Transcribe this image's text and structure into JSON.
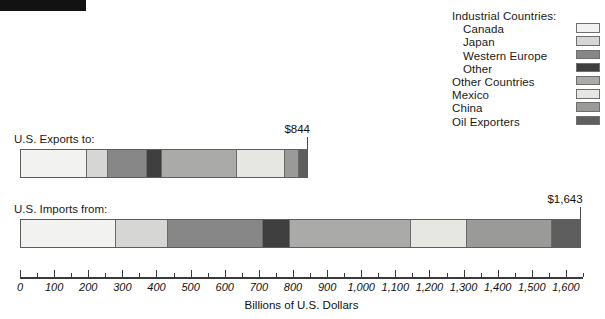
{
  "chart_data": {
    "type": "bar",
    "orientation": "horizontal",
    "stacked": true,
    "title": "",
    "xlabel": "Billions of U.S. Dollars",
    "ylabel": "",
    "xlim": [
      0,
      1650
    ],
    "grid": false,
    "legend_position": "top-right",
    "categories": [
      "U.S. Exports to:",
      "U.S. Imports from:"
    ],
    "totals": [
      844,
      1643
    ],
    "total_labels": [
      "$844",
      "$1,643"
    ],
    "legend_title": "Industrial Countries:",
    "legend_entries": [
      {
        "label": "Industrial Countries:",
        "indent": false,
        "header": true,
        "color": ""
      },
      {
        "label": "Canada",
        "indent": true,
        "header": false,
        "color": "#f2f2f0"
      },
      {
        "label": "Japan",
        "indent": true,
        "header": false,
        "color": "#d6d6d4"
      },
      {
        "label": "Western Europe",
        "indent": true,
        "header": false,
        "color": "#878787"
      },
      {
        "label": "Other",
        "indent": true,
        "header": false,
        "color": "#3f3f3f"
      },
      {
        "label": "Other Countries",
        "indent": false,
        "header": false,
        "color": "#aaaaa8"
      },
      {
        "label": "Mexico",
        "indent": false,
        "header": false,
        "color": "#e6e6e3"
      },
      {
        "label": "China",
        "indent": false,
        "header": false,
        "color": "#9a9a98"
      },
      {
        "label": "Oil Exporters",
        "indent": false,
        "header": false,
        "color": "#5e5e5e"
      }
    ],
    "series": [
      {
        "name": "Canada",
        "color": "#f2f2f0",
        "values": [
          205,
          278
        ]
      },
      {
        "name": "Japan",
        "color": "#d6d6d4",
        "values": [
          65,
          155
        ]
      },
      {
        "name": "Western Europe",
        "color": "#878787",
        "values": [
          118,
          278
        ]
      },
      {
        "name": "Other",
        "color": "#3f3f3f",
        "values": [
          47,
          79
        ]
      },
      {
        "name": "Other Countries",
        "color": "#aaaaa8",
        "values": [
          232,
          358
        ]
      },
      {
        "name": "Mexico",
        "color": "#e6e6e3",
        "values": [
          147,
          164
        ]
      },
      {
        "name": "China",
        "color": "#9a9a98",
        "values": [
          44,
          250
        ]
      },
      {
        "name": "Oil Exporters",
        "color": "#5e5e5e",
        "values": [
          25,
          81
        ]
      }
    ],
    "x_ticks": [
      {
        "value": 0,
        "label": "0",
        "major": true
      },
      {
        "value": 50,
        "label": "",
        "major": false
      },
      {
        "value": 100,
        "label": "100",
        "major": true
      },
      {
        "value": 150,
        "label": "",
        "major": false
      },
      {
        "value": 200,
        "label": "200",
        "major": true
      },
      {
        "value": 250,
        "label": "",
        "major": false
      },
      {
        "value": 300,
        "label": "300",
        "major": true
      },
      {
        "value": 350,
        "label": "",
        "major": false
      },
      {
        "value": 400,
        "label": "400",
        "major": true
      },
      {
        "value": 450,
        "label": "",
        "major": false
      },
      {
        "value": 500,
        "label": "500",
        "major": true
      },
      {
        "value": 550,
        "label": "",
        "major": false
      },
      {
        "value": 600,
        "label": "600",
        "major": true
      },
      {
        "value": 650,
        "label": "",
        "major": false
      },
      {
        "value": 700,
        "label": "700",
        "major": true
      },
      {
        "value": 750,
        "label": "",
        "major": false
      },
      {
        "value": 800,
        "label": "800",
        "major": true
      },
      {
        "value": 850,
        "label": "",
        "major": false
      },
      {
        "value": 900,
        "label": "900",
        "major": true
      },
      {
        "value": 950,
        "label": "",
        "major": false
      },
      {
        "value": 1000,
        "label": "1,000",
        "major": true
      },
      {
        "value": 1050,
        "label": "",
        "major": false
      },
      {
        "value": 1100,
        "label": "1,100",
        "major": true
      },
      {
        "value": 1150,
        "label": "",
        "major": false
      },
      {
        "value": 1200,
        "label": "1,200",
        "major": true
      },
      {
        "value": 1250,
        "label": "",
        "major": false
      },
      {
        "value": 1300,
        "label": "1,300",
        "major": true
      },
      {
        "value": 1350,
        "label": "",
        "major": false
      },
      {
        "value": 1400,
        "label": "1,400",
        "major": true
      },
      {
        "value": 1450,
        "label": "",
        "major": false
      },
      {
        "value": 1500,
        "label": "1,500",
        "major": true
      },
      {
        "value": 1550,
        "label": "",
        "major": false
      },
      {
        "value": 1600,
        "label": "1,600",
        "major": true
      },
      {
        "value": 1650,
        "label": "",
        "major": false
      }
    ]
  },
  "layout": {
    "axis_x0_px": 20,
    "axis_x1_px": 583,
    "axis_y_px": 277,
    "exports_bar_top_px": 149,
    "imports_bar_top_px": 219,
    "exports_label_pos": {
      "x": 14,
      "y": 133
    },
    "imports_label_pos": {
      "x": 14,
      "y": 203
    }
  }
}
